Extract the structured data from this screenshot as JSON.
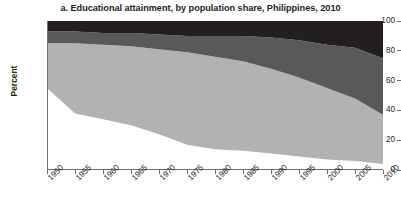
{
  "chart_data": {
    "type": "area",
    "title": "a. Educational attainment, by population share, Philippines, 2010",
    "xlabel": "",
    "ylabel": "Percent",
    "ylim": [
      0,
      100
    ],
    "yticks": [
      0,
      20,
      40,
      60,
      80,
      100
    ],
    "grid": false,
    "legend": "none",
    "stacked": true,
    "categories": [
      1950,
      1955,
      1960,
      1965,
      1970,
      1975,
      1980,
      1985,
      1990,
      1995,
      2000,
      2005,
      2010
    ],
    "x_tick_labels": [
      "1950",
      "1955",
      "1960",
      "1965",
      "1970",
      "1975",
      "1980",
      "1985",
      "1990",
      "1995",
      "2000",
      "2005",
      "2010"
    ],
    "series": [
      {
        "name": "no-schooling-band",
        "color": "#ffffff",
        "values": [
          55,
          38,
          34,
          30,
          24,
          17,
          14,
          13,
          11,
          9,
          7,
          6,
          4
        ]
      },
      {
        "name": "primary-band",
        "color": "#b2b2b2",
        "values": [
          30,
          47,
          50,
          53,
          57,
          62,
          62,
          60,
          57,
          53,
          48,
          42,
          33
        ]
      },
      {
        "name": "secondary-band",
        "color": "#58595b",
        "values": [
          8,
          8,
          8,
          9,
          10,
          11,
          14,
          17,
          21,
          25,
          29,
          34,
          38
        ]
      },
      {
        "name": "tertiary-band",
        "color": "#231f20",
        "values": [
          7,
          7,
          8,
          8,
          9,
          10,
          10,
          10,
          11,
          13,
          16,
          18,
          25
        ]
      }
    ],
    "cumulative_upper_bounds": {
      "band1_top": [
        55,
        38,
        34,
        30,
        24,
        17,
        14,
        13,
        11,
        9,
        7,
        6,
        4
      ],
      "band2_top": [
        85,
        85,
        84,
        83,
        81,
        79,
        76,
        73,
        68,
        62,
        55,
        48,
        37
      ],
      "band3_top": [
        93,
        93,
        92,
        92,
        91,
        90,
        90,
        90,
        89,
        87,
        84,
        82,
        75
      ],
      "band4_top": [
        100,
        100,
        100,
        100,
        100,
        100,
        100,
        100,
        100,
        100,
        100,
        100,
        100
      ]
    }
  },
  "axis_colors": {
    "axis_line": "#6d6e71",
    "text": "#231f20"
  }
}
